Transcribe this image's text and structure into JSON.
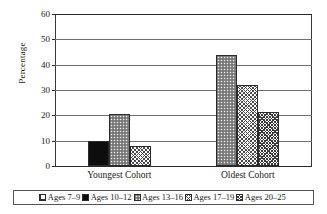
{
  "chart_data": {
    "type": "bar",
    "title": "",
    "subtitle": "",
    "xlabel": "",
    "ylabel": "Percentage",
    "ylim": [
      0,
      60
    ],
    "ytick_step": 10,
    "yticks": [
      0,
      10,
      20,
      30,
      40,
      50,
      60
    ],
    "ytick_labels": [
      "0",
      "10",
      "20",
      "30",
      "40",
      "50",
      "60"
    ],
    "grid": "horizontal",
    "legend_position": "bottom",
    "categories": [
      "Youngest Cohort",
      "Oldest Cohort"
    ],
    "series": [
      {
        "name": "Ages 7–9",
        "pattern": "grid-hatch",
        "values": [
          null,
          null
        ]
      },
      {
        "name": "Ages 10–12",
        "pattern": "solid-black",
        "values": [
          10,
          null
        ]
      },
      {
        "name": "Ages 13–16",
        "pattern": "dotted-gray",
        "values": [
          20.5,
          44
        ]
      },
      {
        "name": "Ages 17–19",
        "pattern": "crosshatch",
        "values": [
          8,
          32
        ]
      },
      {
        "name": "Ages 20–25",
        "pattern": "crosshatch-dense",
        "values": [
          null,
          21.5
        ]
      }
    ],
    "bars": [
      {
        "group": "Youngest Cohort",
        "series": "Ages 10–12",
        "value": 10,
        "pattern": "solid-black"
      },
      {
        "group": "Youngest Cohort",
        "series": "Ages 13–16",
        "value": 20.5,
        "pattern": "dotted-gray"
      },
      {
        "group": "Youngest Cohort",
        "series": "Ages 17–19",
        "value": 8,
        "pattern": "crosshatch"
      },
      {
        "group": "Oldest Cohort",
        "series": "Ages 13–16",
        "value": 44,
        "pattern": "dotted-gray"
      },
      {
        "group": "Oldest Cohort",
        "series": "Ages 17–19",
        "value": 32,
        "pattern": "crosshatch"
      },
      {
        "group": "Oldest Cohort",
        "series": "Ages 20–25",
        "value": 21.5,
        "pattern": "crosshatch-dense"
      }
    ]
  },
  "axis": {
    "y_title": "Percentage",
    "ticks": [
      {
        "label": "60",
        "value": 60
      },
      {
        "label": "50",
        "value": 50
      },
      {
        "label": "40",
        "value": 40
      },
      {
        "label": "30",
        "value": 30
      },
      {
        "label": "20",
        "value": 20
      },
      {
        "label": "10",
        "value": 10
      },
      {
        "label": "0",
        "value": 0
      }
    ]
  },
  "categories": [
    {
      "label": "Youngest Cohort"
    },
    {
      "label": "Oldest Cohort"
    }
  ],
  "legend": {
    "items": [
      {
        "label": "Ages 7–9",
        "pattern": "grid-hatch"
      },
      {
        "label": "Ages 10–12",
        "pattern": "solid-black"
      },
      {
        "label": "Ages 13–16",
        "pattern": "dotted-gray"
      },
      {
        "label": "Ages 17–19",
        "pattern": "crosshatch"
      },
      {
        "label": "Ages 20–25",
        "pattern": "crosshatch-dense"
      }
    ]
  },
  "colors": {
    "background": "#ffffff",
    "axis": "#2a2a2a",
    "gridline": "#6e6e6e",
    "bar_outline": "#2b2b2b",
    "solid_black": "#0d0d0d",
    "dotted_gray": "#8a8a8a",
    "hatch_ink": "#3a3a3a",
    "text": "#1a1a1a"
  }
}
